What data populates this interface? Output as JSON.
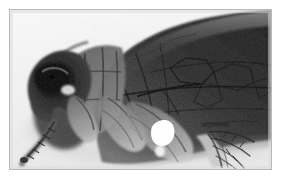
{
  "image": {
    "title": "Flea (Siphonaptera) lateral view photomicrograph",
    "subject": "flea",
    "view": "lateral",
    "medium": "grayscale photomicrograph",
    "frame_color": "#b9b9b9",
    "background_color": "#ffffff",
    "plate_background_color": "#f2f2f2",
    "body_dark_color": "#2b2b2b",
    "body_mid_color": "#5a5a5a",
    "body_light_color": "#9e9e9e",
    "highlight_color": "#ffffff",
    "frame": {
      "left": 9,
      "top": 9,
      "width": 263,
      "height": 161,
      "border_width": 1
    },
    "anatomy": [
      {
        "name": "head-capsule",
        "label": "Head capsule",
        "tone": "very-dark"
      },
      {
        "name": "eye",
        "label": "Eye",
        "tone": "black"
      },
      {
        "name": "antenna",
        "label": "Antenna",
        "tone": "dark"
      },
      {
        "name": "maxillary-palp",
        "label": "Maxillary palp",
        "tone": "dark"
      },
      {
        "name": "thorax",
        "label": "Thorax segments",
        "tone": "mid-dark"
      },
      {
        "name": "abdomen",
        "label": "Abdomen",
        "tone": "dark"
      },
      {
        "name": "foreleg",
        "label": "Foreleg",
        "tone": "mid"
      },
      {
        "name": "midleg",
        "label": "Midleg",
        "tone": "mid"
      },
      {
        "name": "hindleg",
        "label": "Hindleg",
        "tone": "mid"
      },
      {
        "name": "tarsal-bristles",
        "label": "Tarsal bristles",
        "tone": "dark"
      },
      {
        "name": "cuticle-cracks",
        "label": "Cuticle crack network",
        "tone": "dark"
      },
      {
        "name": "specular-highlight",
        "label": "Specular highlight",
        "tone": "white"
      }
    ]
  }
}
